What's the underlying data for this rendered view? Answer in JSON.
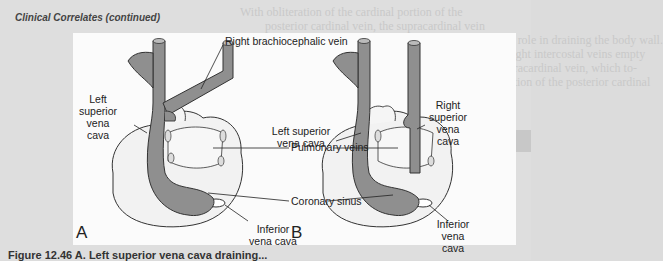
{
  "page": {
    "section_header": "Clinical Correlates (continued)",
    "background_text": {
      "right_column": [
        "With obliteration of the cardinal portion of the",
        "posterior cardinal vein, the supracardinal vein",
        "assumes a greater role in draining the body wall.",
        "The 4th to 11th right intercostal veins empty",
        "into the right supracardinal vein, which to-",
        "gether with a portion of the posterior cardinal"
      ],
      "banner_label": "Clinical Correlates",
      "subheading": "Venous System Defects",
      "lower_right": [
        "The complicated development of the venae cavae",
        "accounts for the fact that deviations from the nor-",
        "mal pattern are common.",
        "A double inferior vena cava occurs when the"
      ],
      "lower_middle": [
        "of the inferior vena cava, an abnormality",
        "frequently seen in pneumonia.",
        "Left superior vena cava is caused by persis-",
        "tence of the left anterior cardinal vein and oblit-",
        "eration of the common cardinal and proximal"
      ]
    },
    "figure": {
      "panel_a": {
        "letter": "A",
        "labels": {
          "right_brachiocephalic_vein": "Right brachiocephalic vein",
          "left_superior_vena_cava": [
            "Left",
            "superior",
            "vena",
            "cava"
          ],
          "pulmonary_veins": "Pulmonary veins",
          "coronary_sinus": "Coronary sinus",
          "inferior_vena_cava": [
            "Inferior",
            "vena cava"
          ]
        }
      },
      "panel_b": {
        "letter": "B",
        "labels": {
          "left_superior_vena_cava": [
            "Left superior",
            "vena cava"
          ],
          "right_superior_vena_cava": [
            "Right",
            "superior",
            "vena",
            "cava"
          ],
          "inferior_vena_cava": [
            "Inferior",
            "vena",
            "cava"
          ]
        }
      },
      "caption_partial": "Figure 12.46  A. Left superior vena cava draining..."
    },
    "colors": {
      "page_bg": "#dedede",
      "figure_bg": "#fbfbfb",
      "vein_fill": "#8f8f8f",
      "heart_fill": "#f2f2f2",
      "outline": "#333333"
    }
  }
}
